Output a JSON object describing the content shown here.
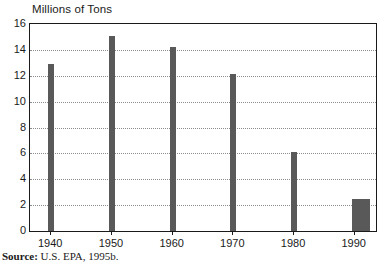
{
  "chart_data": {
    "type": "bar",
    "title": "Millions of Tons",
    "xlabel": "",
    "ylabel": "",
    "categories": [
      "1940",
      "1950",
      "1960",
      "1970",
      "1980",
      "1990",
      "1991",
      "1992"
    ],
    "values": [
      12.9,
      15.1,
      14.2,
      12.1,
      6.1,
      2.5,
      2.5,
      2.5
    ],
    "x": [
      1940,
      1950,
      1960,
      1970,
      1980,
      1990,
      1991,
      1992
    ],
    "xlim": [
      1936.5,
      1993.5
    ],
    "ylim": [
      0,
      16
    ],
    "ytick_labels": [
      "16",
      "14",
      "12",
      "10",
      "8",
      "6",
      "4",
      "2",
      "0"
    ],
    "ytick_values": [
      16,
      14,
      12,
      10,
      8,
      6,
      4,
      2,
      0
    ],
    "xtick_labels": [
      "1940",
      "1950",
      "1960",
      "1970",
      "1980",
      "1990"
    ],
    "xtick_values": [
      1940,
      1950,
      1960,
      1970,
      1980,
      1990
    ],
    "grid": "horizontal-dotted",
    "legend": "none",
    "bar_color": "#595959",
    "grid_color": "#8c8c8c",
    "axis_color": "#1a1a1a"
  },
  "source": {
    "label": "Source:",
    "text": " U.S. EPA, 1995b."
  }
}
